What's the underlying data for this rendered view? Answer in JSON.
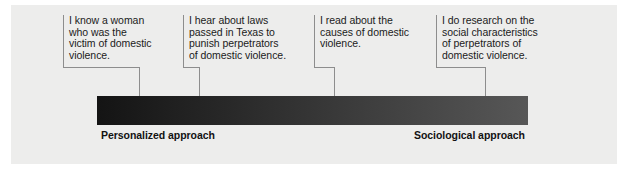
{
  "figure": {
    "name": "domestic-violence-approach-continuum",
    "panel_background": "#ededec",
    "line_color": "#8d8d8d"
  },
  "callouts": [
    {
      "id": "callout-1",
      "text": "I know a woman\nwho was the\nvictim of domestic\nviolence."
    },
    {
      "id": "callout-2",
      "text": "I hear about laws\npassed in Texas to\npunish perpetrators\nof domestic violence."
    },
    {
      "id": "callout-3",
      "text": "I read about the\ncauses of domestic\nviolence."
    },
    {
      "id": "callout-4",
      "text": "I do research on the\nsocial characteristics\nof perpetrators of\ndomestic violence."
    }
  ],
  "spectrum": {
    "left_label": "Personalized approach",
    "right_label": "Sociological approach",
    "gradient_start_color": "#141414",
    "gradient_end_color": "#575757"
  }
}
